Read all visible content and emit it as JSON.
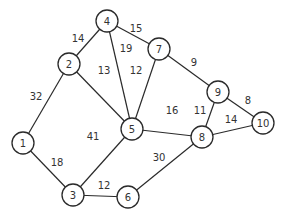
{
  "diagram": {
    "type": "weighted-undirected-graph",
    "node_radius": 11,
    "nodes": [
      {
        "id": "1",
        "label": "1",
        "x": 23,
        "y": 143
      },
      {
        "id": "2",
        "label": "2",
        "x": 69,
        "y": 64
      },
      {
        "id": "3",
        "label": "3",
        "x": 73,
        "y": 195
      },
      {
        "id": "4",
        "label": "4",
        "x": 107,
        "y": 21
      },
      {
        "id": "5",
        "label": "5",
        "x": 132,
        "y": 129
      },
      {
        "id": "6",
        "label": "6",
        "x": 128,
        "y": 197
      },
      {
        "id": "7",
        "label": "7",
        "x": 159,
        "y": 49
      },
      {
        "id": "8",
        "label": "8",
        "x": 202,
        "y": 137
      },
      {
        "id": "9",
        "label": "9",
        "x": 218,
        "y": 92
      },
      {
        "id": "10",
        "label": "10",
        "x": 263,
        "y": 123
      }
    ],
    "edges": [
      {
        "from": "1",
        "to": "2",
        "weight": "32",
        "lx": 36,
        "ly": 96
      },
      {
        "from": "1",
        "to": "3",
        "weight": "18",
        "lx": 57,
        "ly": 162
      },
      {
        "from": "2",
        "to": "4",
        "weight": "14",
        "lx": 78,
        "ly": 38
      },
      {
        "from": "2",
        "to": "5",
        "weight": "13",
        "lx": 104,
        "ly": 70
      },
      {
        "from": "4",
        "to": "7",
        "weight": "15",
        "lx": 136,
        "ly": 28
      },
      {
        "from": "4",
        "to": "5",
        "weight": "19",
        "lx": 126,
        "ly": 48
      },
      {
        "from": "7",
        "to": "5",
        "weight": "12",
        "lx": 136,
        "ly": 70
      },
      {
        "from": "7",
        "to": "9",
        "weight": "9",
        "lx": 194,
        "ly": 62
      },
      {
        "from": "5",
        "to": "8",
        "weight": "16",
        "lx": 172,
        "ly": 110
      },
      {
        "from": "5",
        "to": "3",
        "weight": "41",
        "lx": 93,
        "ly": 136
      },
      {
        "from": "3",
        "to": "6",
        "weight": "12",
        "lx": 104,
        "ly": 185
      },
      {
        "from": "6",
        "to": "8",
        "weight": "30",
        "lx": 159,
        "ly": 157
      },
      {
        "from": "9",
        "to": "8",
        "weight": "11",
        "lx": 200,
        "ly": 110
      },
      {
        "from": "9",
        "to": "10",
        "weight": "8",
        "lx": 248,
        "ly": 100
      },
      {
        "from": "8",
        "to": "10",
        "weight": "14",
        "lx": 231,
        "ly": 119
      }
    ]
  }
}
